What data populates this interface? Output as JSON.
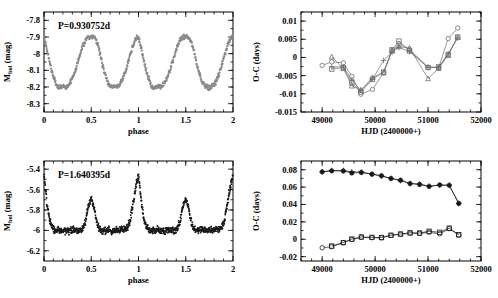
{
  "figure": {
    "panel_count": 4,
    "colors": {
      "light_curve_top": "#8a8a8a",
      "light_curve_bottom": "#1a1a1a",
      "oc_top": "#6e6e6e",
      "oc_bottom": "#1a1a1a",
      "axis": "#000000",
      "background": "#ffffff"
    }
  },
  "chart_data": [
    {
      "panel": "top-left",
      "type": "scatter",
      "title": "",
      "annotation": "P=0.930752d",
      "xlabel": "phase",
      "ylabel": "M_bol (mag)",
      "xlim": [
        0,
        2
      ],
      "ylim": [
        -8.35,
        -7.75
      ],
      "y_inverted": true,
      "xticks": [
        0,
        0.5,
        1,
        1.5,
        2
      ],
      "xticklabels": [
        "0",
        "0.5",
        "1",
        "1.5",
        "2"
      ],
      "yticks": [
        -8.3,
        -8.2,
        -8.1,
        -8,
        -7.9,
        -7.8
      ],
      "yticklabels": [
        "-8.3",
        "-8.2",
        "-8.1",
        "-8",
        "-7.9",
        "-7.8"
      ],
      "grid": false,
      "legend": "none",
      "marker": "filled-circle",
      "marker_color": "#8a8a8a",
      "curve_shape": "sinusoidal-cepheid",
      "scatter_band_mag": 0.022,
      "phase_of_maximum": 0.22,
      "phase_of_minimum": 0.5,
      "magnitude_at_maximum": -8.2,
      "magnitude_at_minimum": -7.9,
      "n_points": 560,
      "x": [
        0.0,
        0.02,
        0.04,
        0.06,
        0.08,
        0.1,
        0.12,
        0.14,
        0.16,
        0.18,
        0.2,
        0.22,
        0.24,
        0.26,
        0.28,
        0.3,
        0.32,
        0.34,
        0.36,
        0.38,
        0.4,
        0.42,
        0.44,
        0.46,
        0.48,
        0.5,
        0.52,
        0.54,
        0.56,
        0.58,
        0.6,
        0.62,
        0.64,
        0.66,
        0.68,
        0.7,
        0.72,
        0.74,
        0.76,
        0.78,
        0.8,
        0.82,
        0.84,
        0.86,
        0.88,
        0.9,
        0.92,
        0.94,
        0.96,
        0.98,
        1.0
      ],
      "y": [
        -7.9,
        -7.95,
        -8.0,
        -8.05,
        -8.1,
        -8.14,
        -8.17,
        -8.195,
        -8.205,
        -8.2,
        -8.195,
        -8.2,
        -8.2,
        -8.19,
        -8.17,
        -8.15,
        -8.12,
        -8.09,
        -8.05,
        -8.01,
        -7.97,
        -7.94,
        -7.92,
        -7.905,
        -7.9,
        -7.895,
        -7.9,
        -7.91,
        -7.93,
        -7.97,
        -8.02,
        -8.07,
        -8.11,
        -8.15,
        -8.175,
        -8.19,
        -8.2,
        -8.2,
        -8.2,
        -8.195,
        -8.185,
        -8.165,
        -8.14,
        -8.11,
        -8.07,
        -8.03,
        -7.99,
        -7.955,
        -7.925,
        -7.905,
        -7.9
      ]
    },
    {
      "panel": "bottom-left",
      "type": "scatter",
      "title": "",
      "annotation": "P=1.640395d",
      "xlabel": "phase",
      "ylabel": "M_bol (mag)",
      "xlim": [
        0,
        2
      ],
      "ylim": [
        -6.3,
        -5.32
      ],
      "y_inverted": true,
      "xticks": [
        0,
        0.5,
        1,
        1.5,
        2
      ],
      "xticklabels": [
        "0",
        "0.5",
        "1",
        "1.5",
        "2"
      ],
      "yticks": [
        -6.2,
        -6,
        -5.8,
        -5.6,
        -5.4
      ],
      "yticklabels": [
        "-6.2",
        "-6",
        "-5.8",
        "-5.6",
        "-5.4"
      ],
      "grid": false,
      "legend": "none",
      "marker": "filled-circle",
      "marker_color": "#1a1a1a",
      "curve_shape": "algol-eclipsing-binary",
      "scatter_band_mag": 0.05,
      "out_of_eclipse_magnitude": -6.0,
      "primary_eclipse_phase": 0.0,
      "primary_eclipse_depth_mag": 0.55,
      "primary_eclipse_min_magnitude": -5.45,
      "secondary_eclipse_phase": 0.5,
      "secondary_eclipse_depth_mag": 0.3,
      "secondary_eclipse_min_magnitude": -5.68,
      "eclipse_half_width_phase": 0.07,
      "n_points": 900,
      "x": [
        0.0,
        0.03,
        0.06,
        0.09,
        0.12,
        0.2,
        0.3,
        0.4,
        0.44,
        0.47,
        0.5,
        0.53,
        0.56,
        0.6,
        0.7,
        0.8,
        0.88,
        0.91,
        0.94,
        0.97,
        1.0
      ],
      "y": [
        -5.45,
        -5.72,
        -5.9,
        -5.97,
        -6.0,
        -6.0,
        -6.0,
        -6.0,
        -5.92,
        -5.76,
        -5.68,
        -5.78,
        -5.93,
        -6.0,
        -6.0,
        -6.0,
        -5.98,
        -5.9,
        -5.75,
        -5.58,
        -5.45
      ]
    },
    {
      "panel": "top-right",
      "type": "line",
      "title": "",
      "xlabel": "HJD (2400000+)",
      "ylabel": "O-C (days)",
      "xlim": [
        48600,
        52000
      ],
      "ylim": [
        -0.015,
        0.0125
      ],
      "xticks": [
        49000,
        50000,
        51000,
        52000
      ],
      "xticklabels": [
        "49000",
        "50000",
        "51000",
        "52000"
      ],
      "yticks": [
        0.01,
        0.005,
        0,
        -0.005,
        -0.01,
        -0.015
      ],
      "yticklabels": [
        "0.01",
        "0.005",
        "0",
        "-0.005",
        "-0.01",
        "-0.015"
      ],
      "grid": false,
      "legend": "none",
      "marker_color": "#6e6e6e",
      "series": [
        {
          "name": "series-1",
          "marker": "open-circle",
          "x": [
            49000,
            49180,
            49400,
            49560,
            49730,
            49950,
            50160,
            50320,
            50450,
            50650,
            51000,
            51200,
            51380,
            51560
          ],
          "y": [
            -0.0022,
            -0.0012,
            -0.0015,
            -0.0052,
            -0.0101,
            -0.0088,
            -0.0042,
            0.0019,
            0.0038,
            0.0022,
            -0.0027,
            -0.0028,
            0.0052,
            0.0081
          ]
        },
        {
          "name": "series-2",
          "marker": "open-square",
          "x": [
            49180,
            49400,
            49560,
            49730,
            49950,
            50160,
            50320,
            50450,
            50650,
            51000,
            51200,
            51380,
            51560
          ],
          "y": [
            -0.0032,
            -0.0028,
            -0.007,
            -0.0095,
            -0.006,
            -0.004,
            0.0021,
            0.0045,
            0.0018,
            -0.0028,
            -0.0026,
            0.0008,
            0.0056
          ]
        },
        {
          "name": "series-3",
          "marker": "open-triangle",
          "x": [
            49180,
            49400,
            49560,
            49730,
            49950,
            50160,
            50320,
            50450,
            50650,
            51000,
            51200,
            51380,
            51560
          ],
          "y": [
            0.0002,
            -0.003,
            -0.0078,
            -0.009,
            -0.0055,
            -0.0042,
            0.0018,
            0.003,
            0.0026,
            -0.0058,
            -0.003,
            0.0006,
            0.0056
          ]
        },
        {
          "name": "series-4",
          "marker": "plus",
          "x": [
            49180,
            49400,
            49560,
            49730,
            49950,
            50160,
            50320,
            50450,
            50650,
            51000,
            51200,
            51380,
            51560
          ],
          "y": [
            -0.0026,
            -0.0026,
            -0.0062,
            -0.009,
            -0.006,
            -0.0008,
            0.0014,
            0.0028,
            0.0016,
            -0.0027,
            -0.0027,
            0.001,
            0.0054
          ]
        }
      ]
    },
    {
      "panel": "bottom-right",
      "type": "line",
      "title": "",
      "xlabel": "HJD (2400000+)",
      "ylabel": "O-C (days)",
      "xlim": [
        48600,
        52000
      ],
      "ylim": [
        -0.025,
        0.09
      ],
      "xticks": [
        49000,
        50000,
        51000,
        52000
      ],
      "xticklabels": [
        "49000",
        "50000",
        "51000",
        "52000"
      ],
      "yticks": [
        0.08,
        0.06,
        0.04,
        0.02,
        0,
        -0.02
      ],
      "yticklabels": [
        "0.08",
        "0.06",
        "0.04",
        "0.02",
        "0",
        "-0.02"
      ],
      "grid": false,
      "legend": "none",
      "marker_color": "#1a1a1a",
      "series": [
        {
          "name": "upper-branch-filled",
          "marker": "filled-circle",
          "x": [
            49000,
            49180,
            49400,
            49560,
            49740,
            49940,
            50120,
            50300,
            50480,
            50660,
            50840,
            51020,
            51220,
            51400,
            51580
          ],
          "y": [
            0.0775,
            0.0787,
            0.0785,
            0.0762,
            0.0768,
            0.0748,
            0.073,
            0.0698,
            0.0678,
            0.064,
            0.063,
            0.0608,
            0.0625,
            0.062,
            0.0412
          ]
        },
        {
          "name": "upper-branch-plus",
          "marker": "plus",
          "x": [
            49000,
            49180,
            49400,
            49560,
            49740,
            49940,
            50120,
            50300,
            50480,
            50660,
            50840,
            51020,
            51220,
            51400,
            51580
          ],
          "y": [
            0.0775,
            0.079,
            0.079,
            0.0775,
            0.0772,
            0.075,
            0.0728,
            0.07,
            0.0676,
            0.0642,
            0.0634,
            0.061,
            0.0622,
            0.0622,
            0.0412
          ]
        },
        {
          "name": "lower-branch-open-circle",
          "marker": "open-circle",
          "x": [
            49000,
            49180,
            49400,
            49560,
            49740,
            49940,
            50120,
            50300,
            50480,
            50660,
            50840,
            51020,
            51220,
            51400,
            51580
          ],
          "y": [
            -0.0098,
            -0.0085,
            -0.004,
            -0.0002,
            0.0022,
            0.0018,
            0.0016,
            0.0044,
            0.0058,
            0.007,
            0.0068,
            0.008,
            0.0062,
            0.0122,
            0.0048
          ]
        },
        {
          "name": "lower-branch-open-square",
          "marker": "open-square",
          "x": [
            49180,
            49400,
            49560,
            49740,
            49940,
            50120,
            50300,
            50480,
            50660,
            50840,
            51020,
            51220,
            51400,
            51580
          ],
          "y": [
            -0.0078,
            -0.0038,
            0.0002,
            0.0026,
            0.0022,
            0.002,
            0.0046,
            0.006,
            0.0074,
            0.0072,
            0.0092,
            0.008,
            0.0128,
            0.0052
          ]
        }
      ]
    }
  ]
}
